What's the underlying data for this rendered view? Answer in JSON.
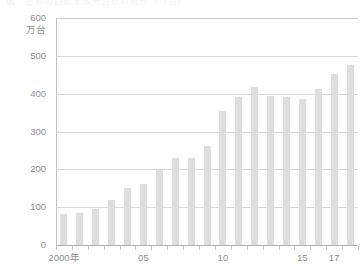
{
  "caption": {
    "text": "図　世界の自動車販売台数の推移（万台）"
  },
  "chart_data": {
    "type": "bar",
    "title": "",
    "subtitle": "",
    "xlabel": "",
    "ylabel": "万台",
    "unit_label": "万台",
    "ylim": [
      0,
      600
    ],
    "ytick_values": [
      0,
      100,
      200,
      300,
      400,
      500,
      600
    ],
    "ytick_labels": [
      "0",
      "100",
      "200",
      "300",
      "400",
      "500",
      "600"
    ],
    "grid": true,
    "legend": "none",
    "bar_color": "#dededf",
    "grid_color": "#d9d9d9",
    "axis_color": "#c2c2c2",
    "text_color": "#8d8d8d",
    "categories": [
      "2000",
      "01",
      "02",
      "03",
      "04",
      "05",
      "06",
      "07",
      "08",
      "09",
      "10",
      "11",
      "12",
      "13",
      "14",
      "15",
      "16",
      "17"
    ],
    "xtick_labels": [
      "2000年",
      "05",
      "10",
      "15",
      "17"
    ],
    "xtick_label_positions": [
      0,
      5,
      10,
      15,
      17
    ],
    "values": [
      82,
      85,
      95,
      118,
      152,
      162,
      198,
      231,
      231,
      262,
      355,
      391,
      418,
      395,
      391,
      386,
      412,
      452
    ],
    "series": [
      {
        "name": "販売台数",
        "values": [
          82,
          85,
          95,
          118,
          152,
          162,
          198,
          231,
          231,
          262,
          355,
          391,
          418,
          395,
          391,
          386,
          412,
          452
        ]
      }
    ],
    "final_value": 477,
    "n_bars": 18
  }
}
